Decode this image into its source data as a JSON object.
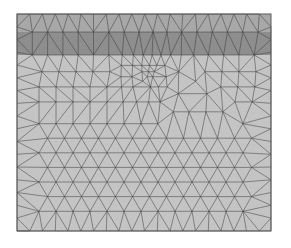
{
  "figure": {
    "type": "finite-element triangular mesh",
    "domain": {
      "x": 17,
      "y": 14,
      "width": 254,
      "height": 217
    },
    "colors": {
      "background": "#ffffff",
      "fill": "#c4c4c4",
      "band_fill": "#8e8e8e",
      "band_top_fill": "#a8a8a8",
      "edge": "#3a3a3a",
      "border": "#5a5a5a"
    },
    "bands": [
      {
        "y0": 14,
        "y1": 32,
        "color": "#a8a8a8"
      },
      {
        "y0": 32,
        "y1": 55,
        "color": "#8e8e8e"
      }
    ],
    "refinement_center": {
      "x": 148,
      "y": 75
    },
    "coarse_spacing": 17,
    "fine_spacing": 5
  }
}
